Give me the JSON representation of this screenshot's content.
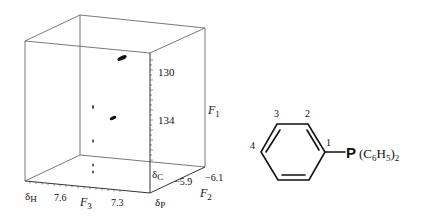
{
  "figure": {
    "type": "3D HCP NMR spectrum with molecular structure",
    "cube": {
      "axes": {
        "F1": {
          "label": "F",
          "subscript": "1",
          "nucleus": "δ",
          "nucleus_sub": "C",
          "ticks": [
            "130",
            "134"
          ]
        },
        "F2": {
          "label": "F",
          "subscript": "2",
          "nucleus": "δ",
          "nucleus_sub": "P",
          "ticks": [
            "-5.9",
            "-6.1"
          ]
        },
        "F3": {
          "label": "F",
          "subscript": "3",
          "nucleus": "δ",
          "nucleus_sub": "H",
          "ticks": [
            "7.6",
            "7.3"
          ]
        }
      },
      "peaks": [
        {
          "id": "peak-1",
          "size": "large"
        },
        {
          "id": "peak-2",
          "size": "medium"
        },
        {
          "id": "peak-3",
          "size": "small"
        },
        {
          "id": "peak-4",
          "size": "small"
        },
        {
          "id": "peak-5",
          "size": "small"
        },
        {
          "id": "peak-6",
          "size": "small"
        }
      ]
    },
    "molecule": {
      "ring_positions": [
        "1",
        "2",
        "3",
        "4"
      ],
      "substituent": {
        "atom": "P",
        "group_open": "(C",
        "c_sub": "6",
        "h": "H",
        "h_sub": "5",
        "group_close": ")",
        "count": "2"
      }
    }
  }
}
